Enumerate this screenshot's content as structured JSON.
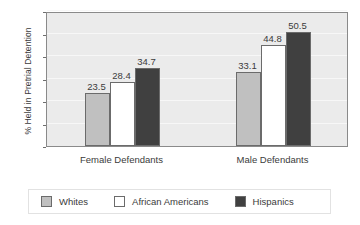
{
  "chart_data": {
    "type": "bar",
    "title": "",
    "subtitle": "",
    "xlabel": "",
    "ylabel": "% Held in Pretrial Detention",
    "categories": [
      "Female Defendants",
      "Male Defendants"
    ],
    "series": [
      {
        "name": "Whites",
        "color": "#c0c0c0",
        "values": [
          23.5,
          33.1
        ]
      },
      {
        "name": "African Americans",
        "color": "#ffffff",
        "values": [
          28.4,
          44.8
        ]
      },
      {
        "name": "Hispanics",
        "color": "#404040",
        "values": [
          34.7,
          50.5
        ]
      }
    ],
    "ylim": [
      0,
      60
    ],
    "yticks": [
      0,
      10,
      20,
      30,
      40,
      50,
      60
    ],
    "ytick_labels": [
      "0",
      "10",
      "20",
      "30",
      "40",
      "50",
      "60"
    ],
    "grid": true,
    "grid_axis": "y",
    "legend_position": "bottom",
    "data_labels": true,
    "plot_background": "#ebebeb",
    "axis_color": "#8a8a8a"
  }
}
